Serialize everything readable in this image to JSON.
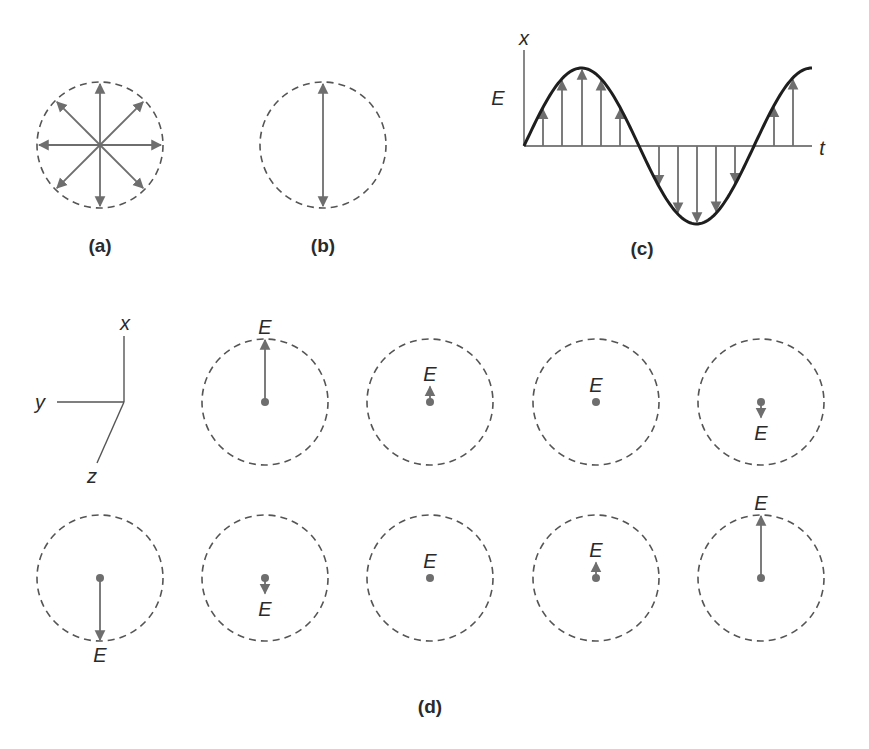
{
  "panels": {
    "a": {
      "caption": "(a)",
      "description": "unpolarized light, E vectors in all directions"
    },
    "b": {
      "caption": "(b)",
      "description": "linearly polarized light, E vector vertical"
    },
    "c": {
      "caption": "(c)",
      "axis_x_label": "x",
      "axis_y_label": "E",
      "axis_t_label": "t"
    },
    "d": {
      "caption": "(d)",
      "axes": {
        "x": "x",
        "y": "y",
        "z": "z"
      },
      "field_label": "E",
      "row1": [
        {
          "amplitude": 1.0
        },
        {
          "amplitude": 0.25
        },
        {
          "amplitude": 0.0
        },
        {
          "amplitude": -0.25
        }
      ],
      "row2": [
        {
          "amplitude": -1.0
        },
        {
          "amplitude": -0.25
        },
        {
          "amplitude": 0.0
        },
        {
          "amplitude": 0.25
        },
        {
          "amplitude": 1.0
        }
      ]
    }
  },
  "colors": {
    "arrow": "#6e6e6e",
    "curve": "#1e1e1e",
    "circle": "#555555",
    "text": "#2a2a2a"
  }
}
